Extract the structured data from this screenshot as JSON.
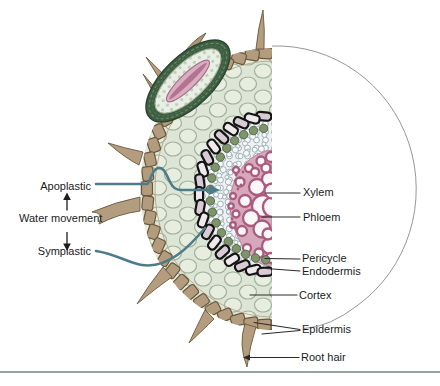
{
  "figure_labels": {
    "apoplastic": "Apoplastic",
    "water_movement": "Water movement",
    "symplastic": "Symplastic",
    "xylem": "Xylem",
    "phloem": "Phloem",
    "pericycle": "Pericycle",
    "endodermis": "Endodermis",
    "cortex": "Cortex",
    "epidermis": "Epidermis",
    "root_hair": "Root hair"
  },
  "colors": {
    "cortex_cell": "#e7eddf",
    "cortex_wall": "#a2b09c",
    "cortex_bg": "#dde6d6",
    "epidermis": "#b39c7d",
    "epidermis_outline": "#6a583d",
    "endodermis_outline": "#141414",
    "pericycle": "#7f9468",
    "xylem_wall": "#ab5c7e",
    "xylem_ground": "#d7a8bc",
    "stele_cell": "#f7fafa",
    "water_path": "#4d7b8a",
    "leader_line": "#2a2a2a",
    "outline_arc": "#8a8a8a",
    "lateral_root_outer": "#3f5f43",
    "bottom_rule": "#9ba0a3"
  }
}
